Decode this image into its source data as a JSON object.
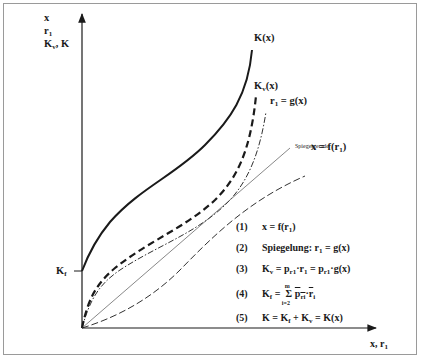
{
  "y_axis": {
    "labels": [
      "x",
      "r",
      "K",
      ", K"
    ],
    "label_r_sub": "1",
    "label_k_sub": "v",
    "tick_label": "K",
    "tick_label_sub": "f"
  },
  "x_axis": {
    "label_x": "x, r",
    "label_sub": "1"
  },
  "curves": {
    "k": {
      "label": "K(x)",
      "style": "solid-thick"
    },
    "kv": {
      "label_main": "K",
      "label_sub": "v",
      "label_tail": "(x)",
      "style": "dashed-thick"
    },
    "g": {
      "label_main": "r",
      "label_sub": "1",
      "label_tail": " = g(x)",
      "style": "dash-dot"
    },
    "mirror": {
      "label": "Spiegelgerade",
      "style": "solid-thin"
    },
    "f": {
      "label_main": "x = f(r",
      "label_sub": "1",
      "label_tail": ")",
      "style": "long-dash"
    }
  },
  "equations": [
    {
      "num": "(1)",
      "text": "x = f(r",
      "sub": "1",
      "tail": ")"
    },
    {
      "num": "(2)",
      "text": "Spiegelung: r",
      "sub": "1",
      "tail": " = g(x)"
    },
    {
      "num": "(3)",
      "a": "K",
      "a_sub": "v",
      "b": " = p",
      "b_sub": "r1",
      "c": "·r",
      "c_sub": "1",
      "d": " = p",
      "d_sub": "r1",
      "e": "·g(x)"
    },
    {
      "num": "(4)",
      "a": "K",
      "a_sub": "f",
      "eq": " = ",
      "sum": "Σ",
      "sum_top": "m",
      "sum_bot": "i=2",
      "p": "p",
      "p_sub": "ri",
      "dot": "·",
      "r": "r",
      "r_sub": "i"
    },
    {
      "num": "(5)",
      "a": "K = K",
      "a_sub": "f",
      "b": " + K",
      "b_sub": "v",
      "c": " = K(x)"
    }
  ],
  "colors": {
    "line": "#1a1a1a",
    "frame": "#9a9a9a"
  }
}
